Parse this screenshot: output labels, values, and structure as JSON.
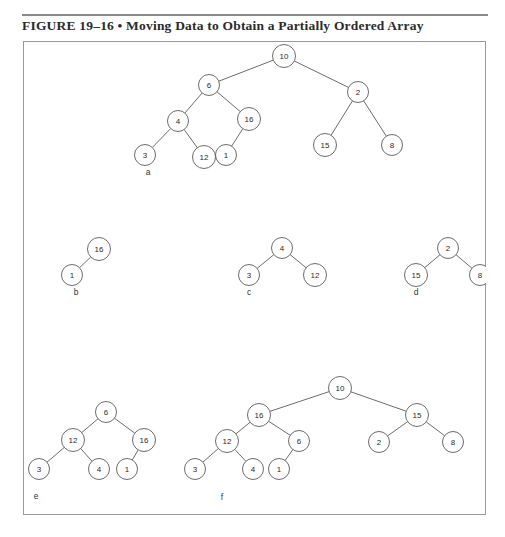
{
  "caption": {
    "text": "FIGURE 19–16 • Moving Data to Obtain a Partially Ordered Array"
  },
  "figure": {
    "panel_labels": [
      "a",
      "b",
      "c",
      "d",
      "e",
      "f"
    ],
    "colors": {
      "stroke": "#5b5b5b",
      "text": "#2b2b2b",
      "frame": "#9a9a9a",
      "rule": "#8a8a8a"
    }
  },
  "chart_data": {
    "type": "diagram",
    "title": "FIGURE 19–16 • Moving Data to Obtain a Partially Ordered Array",
    "diagram_kind": "binary-heap-trees",
    "panels": [
      {
        "label": "a",
        "label_pos": {
          "x": 125,
          "y": 131
        },
        "nodes": [
          {
            "id": "a10",
            "value": "10",
            "x": 261,
            "y": 15
          },
          {
            "id": "a6",
            "value": "6",
            "x": 186,
            "y": 44
          },
          {
            "id": "a2",
            "value": "2",
            "x": 335,
            "y": 51
          },
          {
            "id": "a4",
            "value": "4",
            "x": 155,
            "y": 80
          },
          {
            "id": "a16",
            "value": "16",
            "x": 226,
            "y": 78
          },
          {
            "id": "a15",
            "value": "15",
            "x": 302,
            "y": 104
          },
          {
            "id": "a8",
            "value": "8",
            "x": 369,
            "y": 104
          },
          {
            "id": "a3",
            "value": "3",
            "x": 122,
            "y": 114
          },
          {
            "id": "a12",
            "value": "12",
            "x": 181,
            "y": 116
          },
          {
            "id": "a1",
            "value": "1",
            "x": 203,
            "y": 114
          }
        ],
        "edges": [
          [
            "a10",
            "a6"
          ],
          [
            "a10",
            "a2"
          ],
          [
            "a6",
            "a4"
          ],
          [
            "a6",
            "a16"
          ],
          [
            "a4",
            "a3"
          ],
          [
            "a4",
            "a12"
          ],
          [
            "a16",
            "a1"
          ],
          [
            "a2",
            "a15"
          ],
          [
            "a2",
            "a8"
          ]
        ]
      },
      {
        "label": "b",
        "label_pos": {
          "x": 53,
          "y": 251
        },
        "nodes": [
          {
            "id": "b16",
            "value": "16",
            "x": 76,
            "y": 208
          },
          {
            "id": "b1",
            "value": "1",
            "x": 49,
            "y": 234
          }
        ],
        "edges": [
          [
            "b16",
            "b1"
          ]
        ]
      },
      {
        "label": "c",
        "label_pos": {
          "x": 226,
          "y": 251
        },
        "nodes": [
          {
            "id": "c4",
            "value": "4",
            "x": 259,
            "y": 207
          },
          {
            "id": "c3",
            "value": "3",
            "x": 226,
            "y": 234
          },
          {
            "id": "c12",
            "value": "12",
            "x": 292,
            "y": 234
          }
        ],
        "edges": [
          [
            "c4",
            "c3"
          ],
          [
            "c4",
            "c12"
          ]
        ]
      },
      {
        "label": "d",
        "label_pos": {
          "x": 393,
          "y": 251
        },
        "nodes": [
          {
            "id": "d2",
            "value": "2",
            "x": 425,
            "y": 207
          },
          {
            "id": "d15",
            "value": "15",
            "x": 393,
            "y": 234
          },
          {
            "id": "d8",
            "value": "8",
            "x": 457,
            "y": 234
          }
        ],
        "edges": [
          [
            "d2",
            "d15"
          ],
          [
            "d2",
            "d8"
          ]
        ]
      },
      {
        "label": "e",
        "label_pos": {
          "x": 13,
          "y": 455
        },
        "nodes": [
          {
            "id": "e6",
            "value": "6",
            "x": 83,
            "y": 371
          },
          {
            "id": "e12",
            "value": "12",
            "x": 50,
            "y": 399
          },
          {
            "id": "e16",
            "value": "16",
            "x": 121,
            "y": 399
          },
          {
            "id": "e3",
            "value": "3",
            "x": 16,
            "y": 428
          },
          {
            "id": "e4",
            "value": "4",
            "x": 76,
            "y": 428
          },
          {
            "id": "e1",
            "value": "1",
            "x": 104,
            "y": 428
          }
        ],
        "edges": [
          [
            "e6",
            "e12"
          ],
          [
            "e6",
            "e16"
          ],
          [
            "e12",
            "e3"
          ],
          [
            "e12",
            "e4"
          ],
          [
            "e16",
            "e1"
          ]
        ]
      },
      {
        "label": "f",
        "label_pos": {
          "x": 199,
          "y": 456
        },
        "nodes": [
          {
            "id": "f10",
            "value": "10",
            "x": 317,
            "y": 347
          },
          {
            "id": "f16",
            "value": "16",
            "x": 236,
            "y": 374
          },
          {
            "id": "f15",
            "value": "15",
            "x": 394,
            "y": 374
          },
          {
            "id": "f12",
            "value": "12",
            "x": 204,
            "y": 400
          },
          {
            "id": "f6",
            "value": "6",
            "x": 276,
            "y": 400
          },
          {
            "id": "f2",
            "value": "2",
            "x": 356,
            "y": 401
          },
          {
            "id": "f8",
            "value": "8",
            "x": 430,
            "y": 401
          },
          {
            "id": "f3",
            "value": "3",
            "x": 172,
            "y": 428
          },
          {
            "id": "f4",
            "value": "4",
            "x": 230,
            "y": 428
          },
          {
            "id": "f1",
            "value": "1",
            "x": 256,
            "y": 428
          }
        ],
        "edges": [
          [
            "f10",
            "f16"
          ],
          [
            "f10",
            "f15"
          ],
          [
            "f16",
            "f12"
          ],
          [
            "f16",
            "f6"
          ],
          [
            "f12",
            "f3"
          ],
          [
            "f12",
            "f4"
          ],
          [
            "f6",
            "f1"
          ],
          [
            "f15",
            "f2"
          ],
          [
            "f15",
            "f8"
          ]
        ]
      }
    ]
  }
}
